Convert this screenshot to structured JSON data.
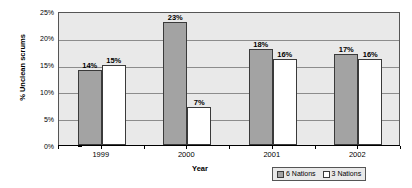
{
  "chart_data": {
    "type": "bar",
    "title": "",
    "xlabel": "Year",
    "ylabel": "% Unclean scrums",
    "categories": [
      "1999",
      "2000",
      "2001",
      "2002"
    ],
    "series": [
      {
        "name": "6 Nations",
        "color": "#a3a3a3",
        "values": [
          14,
          23,
          18,
          17
        ],
        "labels": [
          "14%",
          "23%",
          "18%",
          "17%"
        ]
      },
      {
        "name": "3 Nations",
        "color": "#ffffff",
        "values": [
          15,
          7,
          16,
          16
        ],
        "labels": [
          "15%",
          "7%",
          "16%",
          "16%"
        ]
      }
    ],
    "ylim": [
      0,
      25
    ],
    "y_ticks": [
      0,
      5,
      10,
      15,
      20,
      25
    ],
    "y_tick_labels": [
      "0%",
      "5%",
      "10%",
      "15%",
      "20%",
      "25%"
    ],
    "grid": true,
    "legend_position": "bottom-right",
    "plot_background": "#e9e9e9",
    "border_color": "#555555"
  },
  "legend": {
    "entries": [
      {
        "label": "6 Nations"
      },
      {
        "label": "3 Nations"
      }
    ]
  }
}
